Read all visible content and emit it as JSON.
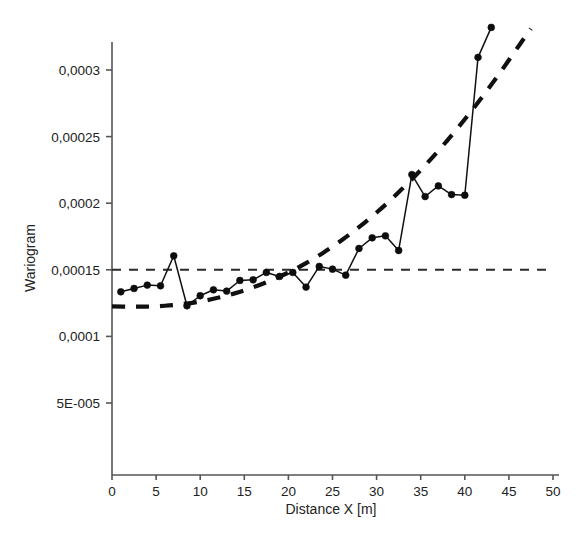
{
  "chart_data": {
    "type": "line",
    "title": "",
    "xlabel": "Distance X [m]",
    "ylabel": "Wariogram",
    "xlim": [
      0,
      50
    ],
    "ylim": [
      0,
      0.00033
    ],
    "grid": false,
    "legend": "none",
    "xticks": [
      0,
      5,
      10,
      15,
      20,
      25,
      30,
      35,
      40,
      45,
      50
    ],
    "xtick_labels": [
      "0",
      "5",
      "10",
      "15",
      "20",
      "25",
      "30",
      "35",
      "40",
      "45",
      "50"
    ],
    "yticks": [
      5e-05,
      0.0001,
      0.00015,
      0.0002,
      0.00025,
      0.0003
    ],
    "ytick_labels": [
      "5E-005",
      "0,0001",
      "0,00015",
      "0,0002",
      "0,00025",
      "0,0003"
    ],
    "series": [
      {
        "name": "Wariogram empiryczny",
        "style": "solid-with-markers",
        "marker": "filled-circle",
        "x": [
          1.0,
          2.5,
          4.0,
          5.5,
          7.0,
          8.5,
          10.0,
          11.5,
          13.0,
          14.5,
          16.0,
          17.5,
          19.0,
          20.5,
          22.0,
          23.5,
          25.0,
          26.5,
          28.0,
          29.5,
          31.0,
          32.5,
          34.0,
          35.5,
          37.0,
          38.5,
          40.0,
          41.5,
          43.0
        ],
        "y": [
          0.0001335,
          0.000136,
          0.0001385,
          0.000138,
          0.0001605,
          0.000123,
          0.0001305,
          0.000135,
          0.000134,
          0.000142,
          0.0001425,
          0.000148,
          0.000145,
          0.000148,
          0.000137,
          0.0001525,
          0.0001505,
          0.000146,
          0.000166,
          0.000174,
          0.0001755,
          0.0001645,
          0.0002215,
          0.000205,
          0.000213,
          0.0002065,
          0.000206,
          0.0003095,
          0.000332
        ]
      },
      {
        "name": "Model teoretyczny",
        "style": "thick-dashed",
        "x": [
          0.0,
          2.0,
          4.0,
          6.0,
          8.0,
          10.0,
          12.0,
          14.0,
          16.0,
          18.0,
          20.0,
          22.0,
          24.0,
          26.0,
          28.0,
          30.0,
          32.0,
          34.0,
          36.0,
          38.0,
          40.0,
          42.0,
          44.0,
          46.0,
          47.5
        ],
        "y": [
          0.0001225,
          0.0001223,
          0.0001224,
          0.000123,
          0.0001243,
          0.0001262,
          0.000129,
          0.0001325,
          0.0001368,
          0.000142,
          0.000148,
          0.000155,
          0.000163,
          0.000172,
          0.000182,
          0.000193,
          0.000205,
          0.000218,
          0.000232,
          0.000247,
          0.000263,
          0.00028,
          0.000298,
          0.000317,
          0.000331
        ]
      },
      {
        "name": "Sill",
        "style": "thin-dashed-horizontal",
        "x": [
          0.0,
          50.0
        ],
        "y": [
          0.00015,
          0.00015
        ]
      }
    ],
    "annotations": {
      "nugget": 0.000122,
      "sill": 0.00015
    }
  },
  "axes": {
    "y_axis_title": "Wariogram",
    "x_axis_title": "Distance X [m]"
  }
}
